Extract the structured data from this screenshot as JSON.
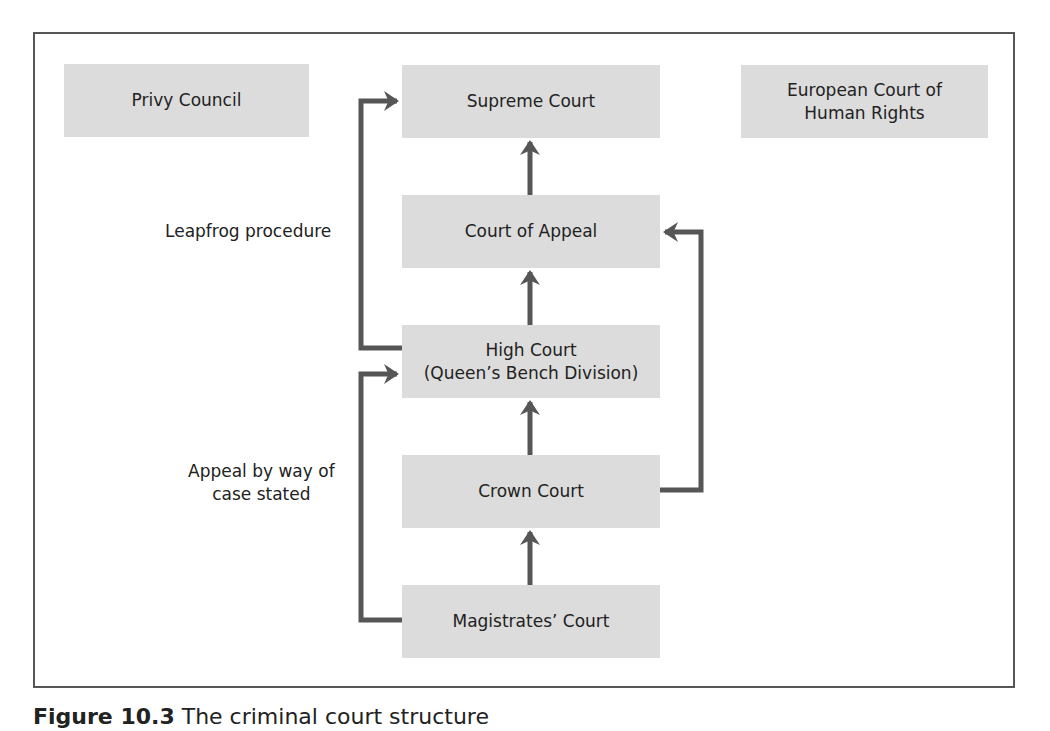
{
  "diagram": {
    "title": "Criminal court structure",
    "courts": {
      "privy_council": "Privy Council",
      "supreme_court": "Supreme Court",
      "echr_line1": "European Court of",
      "echr_line2": "Human Rights",
      "court_of_appeal": "Court of Appeal",
      "high_court_line1": "High Court",
      "high_court_line2": "(Queen’s Bench Division)",
      "crown_court": "Crown Court",
      "magistrates_court": "Magistrates’ Court"
    },
    "labels": {
      "leapfrog": "Leapfrog procedure",
      "case_stated_line1": "Appeal by way of",
      "case_stated_line2": "case stated"
    },
    "edges": [
      {
        "from": "Court of Appeal",
        "to": "Supreme Court"
      },
      {
        "from": "High Court",
        "to": "Supreme Court",
        "label": "Leapfrog procedure"
      },
      {
        "from": "High Court",
        "to": "Court of Appeal"
      },
      {
        "from": "Crown Court",
        "to": "High Court"
      },
      {
        "from": "Crown Court",
        "to": "Court of Appeal"
      },
      {
        "from": "Magistrates’ Court",
        "to": "Crown Court"
      },
      {
        "from": "Magistrates’ Court",
        "to": "High Court",
        "label": "Appeal by way of case stated"
      }
    ],
    "colors": {
      "box_fill": "#dcdcdc",
      "line": "#565656",
      "text": "#222222"
    }
  },
  "caption": {
    "figure_number": "Figure 10.3",
    "text": "The criminal court structure"
  }
}
